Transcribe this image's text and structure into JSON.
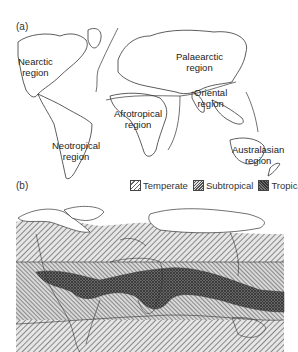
{
  "figure": {
    "panel_a": {
      "label": "(a)",
      "title": "Zoogeographic regions",
      "regions": [
        {
          "name": "Nearctic",
          "line1": "Nearctic",
          "line2": "region"
        },
        {
          "name": "Palaearctic",
          "line1": "Palaearctic",
          "line2": "region"
        },
        {
          "name": "Oriental",
          "line1": "Oriental",
          "line2": "region"
        },
        {
          "name": "Afrotropical",
          "line1": "Afrotropical",
          "line2": "region"
        },
        {
          "name": "Neotropical",
          "line1": "Neotropical",
          "line2": "region"
        },
        {
          "name": "Australasian",
          "line1": "Australasian",
          "line2": "region"
        }
      ]
    },
    "panel_b": {
      "label": "(b)",
      "legend": [
        {
          "label": "Temperate",
          "pattern": "sparse-hatch"
        },
        {
          "label": "Subtropical",
          "pattern": "dense-hatch"
        },
        {
          "label": "Tropical",
          "pattern": "dark-crosshatch"
        }
      ]
    }
  },
  "colors": {
    "line": "#333333",
    "temperate": "#bdbdbd",
    "subtropical": "#9a9a9a",
    "tropical": "#555555"
  }
}
